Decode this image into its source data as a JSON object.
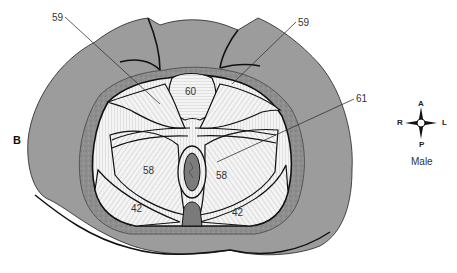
{
  "figure": {
    "panel_label": "B",
    "labels": [
      {
        "id": "59-left",
        "text": "59",
        "x": 52,
        "y": 13
      },
      {
        "id": "59-right",
        "text": "59",
        "x": 298,
        "y": 18
      },
      {
        "id": "60",
        "text": "60",
        "x": 185,
        "y": 87
      },
      {
        "id": "61",
        "text": "61",
        "x": 356,
        "y": 94
      },
      {
        "id": "58-left",
        "text": "58",
        "x": 143,
        "y": 166
      },
      {
        "id": "58-right",
        "text": "58",
        "x": 216,
        "y": 171
      },
      {
        "id": "42-left",
        "text": "42",
        "x": 131,
        "y": 204
      },
      {
        "id": "42-right",
        "text": "42",
        "x": 232,
        "y": 208
      }
    ],
    "compass": {
      "anterior": "A",
      "posterior": "P",
      "right": "R",
      "left": "L",
      "caption": "Male"
    },
    "colors": {
      "skin": "#9a9a9a",
      "fascia": "#8a8a8a",
      "muscle": "#f2f2f2",
      "outline": "#111111",
      "anus": "#7a7a7a"
    }
  }
}
